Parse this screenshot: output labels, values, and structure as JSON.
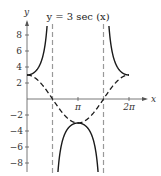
{
  "chart_data": {
    "type": "line",
    "title": "y = 3 sec (x)",
    "xlabel": "x",
    "ylabel": "y",
    "x_ticks": [
      {
        "value": 3.14159,
        "label": "π"
      },
      {
        "value": 6.28318,
        "label": "2π"
      }
    ],
    "y_ticks": [
      8,
      6,
      4,
      2,
      -2,
      -4,
      -6,
      -8
    ],
    "xlim": [
      0,
      6.9
    ],
    "ylim": [
      -9,
      9.5
    ],
    "asymptotes": [
      {
        "x": 1.5708,
        "label": "π/2"
      },
      {
        "x": 4.7124,
        "label": "3π/2"
      }
    ],
    "series": [
      {
        "name": "3 sec(x)",
        "style": "solid",
        "function": "3/cos(x)",
        "domain": [
          0,
          6.28318
        ]
      },
      {
        "name": "3 cos(x)",
        "style": "dashed",
        "function": "3*cos(x)",
        "domain": [
          0,
          6.28318
        ]
      }
    ],
    "grid": false,
    "legend": "none"
  },
  "colors": {
    "axis": "#555555",
    "curve": "#1a1a1a",
    "asymptote": "#999999"
  }
}
